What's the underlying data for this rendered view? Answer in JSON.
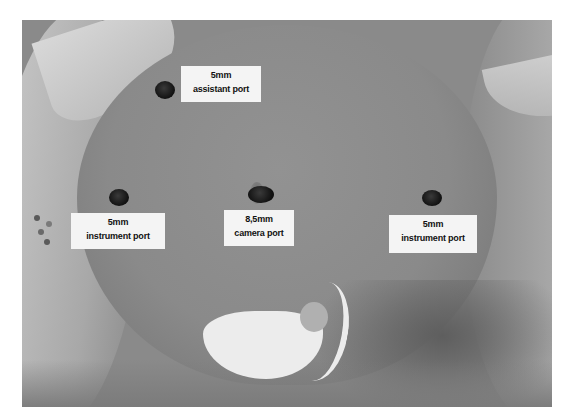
{
  "image": {
    "description": "Grayscale photograph of an infant abdomen showing laparoscopic trocar port placement",
    "ports": [
      {
        "id": "assistant",
        "size": "5mm",
        "name": "assistant port"
      },
      {
        "id": "left-instrument",
        "size": "5mm",
        "name": "instrument port"
      },
      {
        "id": "camera",
        "size": "8,5mm",
        "name": "camera port"
      },
      {
        "id": "right-instrument",
        "size": "5mm",
        "name": "instrument port"
      }
    ]
  }
}
